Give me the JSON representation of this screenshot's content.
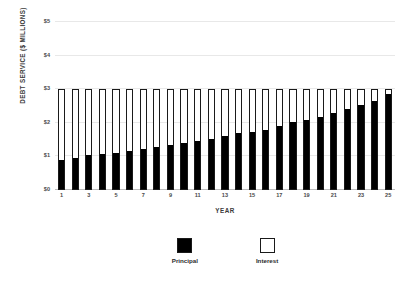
{
  "chart_data": {
    "type": "bar",
    "title": "",
    "subtitle": "",
    "xlabel": "YEAR",
    "ylabel": "DEBT SERVICE ($ MILLIONS)",
    "stacked": true,
    "grid": true,
    "legend_position": "bottom",
    "ylim": [
      0,
      5
    ],
    "ytick_values": [
      0,
      1,
      2,
      3,
      4,
      5
    ],
    "ytick_labels": [
      "$0",
      "$1",
      "$2",
      "$3",
      "$4",
      "$5"
    ],
    "categories": [
      1,
      2,
      3,
      4,
      5,
      6,
      7,
      8,
      9,
      10,
      11,
      12,
      13,
      14,
      15,
      16,
      17,
      18,
      19,
      20,
      21,
      22,
      23,
      24,
      25
    ],
    "xtick_labels": [
      "1",
      "",
      "3",
      "",
      "5",
      "",
      "7",
      "",
      "9",
      "",
      "11",
      "",
      "13",
      "",
      "15",
      "",
      "17",
      "",
      "19",
      "",
      "21",
      "",
      "23",
      "",
      "25"
    ],
    "series": [
      {
        "name": "Principal",
        "color": "#000000",
        "values": [
          0.88,
          0.93,
          1.02,
          1.06,
          1.1,
          1.15,
          1.22,
          1.27,
          1.33,
          1.4,
          1.46,
          1.52,
          1.6,
          1.69,
          1.74,
          1.8,
          1.9,
          2.03,
          2.1,
          2.18,
          2.31,
          2.42,
          2.55,
          2.68,
          2.88
        ]
      },
      {
        "name": "Interest",
        "color": "#ffffff",
        "values": [
          2.12,
          2.07,
          1.98,
          1.94,
          1.9,
          1.85,
          1.78,
          1.73,
          1.67,
          1.6,
          1.54,
          1.48,
          1.4,
          1.31,
          1.26,
          1.2,
          1.1,
          0.97,
          0.9,
          0.82,
          0.69,
          0.58,
          0.45,
          0.32,
          0.12
        ]
      }
    ],
    "totals": [
      3,
      3,
      3,
      3,
      3,
      3,
      3,
      3,
      3,
      3,
      3,
      3,
      3,
      3,
      3,
      3,
      3,
      3,
      3,
      3,
      3,
      3,
      3,
      3,
      3
    ]
  },
  "legend": {
    "items": [
      {
        "label": "Principal",
        "swatch": "filled-black-square"
      },
      {
        "label": "Interest",
        "swatch": "hollow-white-square"
      }
    ]
  },
  "colors": {
    "principal": "#000000",
    "interest": "#ffffff",
    "bar_outline": "#1a1a1a",
    "gridline": "#e8e8e8",
    "baseline": "#bdbdbd",
    "text": "#3b3b3b",
    "background": "#ffffff"
  }
}
